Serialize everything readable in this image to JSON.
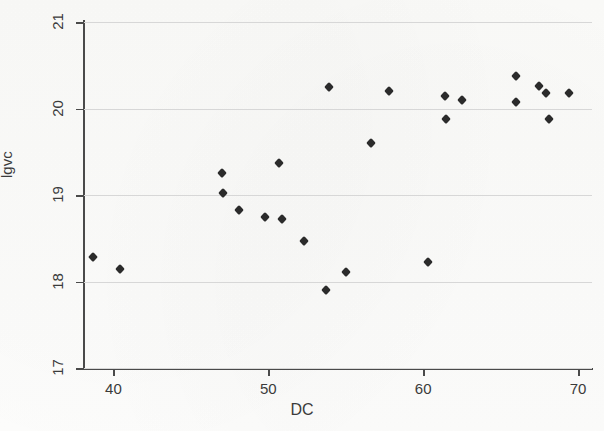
{
  "chart_data": {
    "type": "scatter",
    "title": "",
    "xlabel": "DC",
    "ylabel": "lgvc",
    "xlim": [
      38.1,
      70.9
    ],
    "ylim": [
      17,
      21
    ],
    "xticks": [
      40,
      50,
      60,
      70
    ],
    "yticks": [
      17,
      18,
      19,
      20,
      21
    ],
    "xtick_labels": [
      "40",
      "50",
      "60",
      "70"
    ],
    "ytick_labels": [
      "17",
      "18",
      "19",
      "20",
      "21"
    ],
    "grid": "horizontal",
    "legend": "none",
    "marker": "diamond",
    "marker_color": "#2b2b2b",
    "points": [
      {
        "x": 38.7,
        "y": 18.28
      },
      {
        "x": 40.4,
        "y": 18.15
      },
      {
        "x": 47.0,
        "y": 19.25
      },
      {
        "x": 47.1,
        "y": 19.02
      },
      {
        "x": 48.1,
        "y": 18.83
      },
      {
        "x": 49.8,
        "y": 18.75
      },
      {
        "x": 50.7,
        "y": 19.37
      },
      {
        "x": 50.9,
        "y": 18.72
      },
      {
        "x": 52.3,
        "y": 18.47
      },
      {
        "x": 53.9,
        "y": 20.25
      },
      {
        "x": 53.7,
        "y": 17.9
      },
      {
        "x": 55.0,
        "y": 18.11
      },
      {
        "x": 56.6,
        "y": 19.6
      },
      {
        "x": 57.8,
        "y": 20.2
      },
      {
        "x": 60.3,
        "y": 18.22
      },
      {
        "x": 61.4,
        "y": 20.15
      },
      {
        "x": 61.5,
        "y": 19.88
      },
      {
        "x": 62.5,
        "y": 20.1
      },
      {
        "x": 66.0,
        "y": 20.38
      },
      {
        "x": 66.0,
        "y": 20.08
      },
      {
        "x": 67.5,
        "y": 20.26
      },
      {
        "x": 67.9,
        "y": 20.18
      },
      {
        "x": 68.1,
        "y": 19.88
      },
      {
        "x": 69.4,
        "y": 20.18
      }
    ]
  },
  "axes": {
    "ylabel": "lgvc",
    "xlabel": "DC"
  }
}
